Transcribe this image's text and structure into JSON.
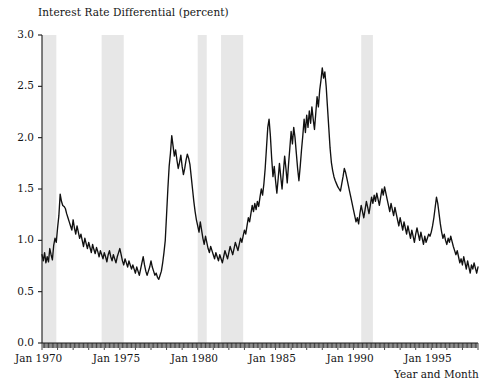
{
  "chart_data": {
    "type": "line",
    "title": "Interest Rate Differential (percent)",
    "xlabel": "Year and Month",
    "ylabel": "",
    "ylim": [
      0.0,
      3.0
    ],
    "xlim": [
      "Jan 1970",
      "Dec 1997"
    ],
    "grid": false,
    "legend": "none",
    "yticks": [
      "0.0",
      "0.5",
      "1.0",
      "1.5",
      "2.0",
      "2.5",
      "3.0"
    ],
    "ytick_values": [
      0.0,
      0.5,
      1.0,
      1.5,
      2.0,
      2.5,
      3.0
    ],
    "xticks": [
      "Jan 1970",
      "Jan 1975",
      "Jan 1980",
      "Jan 1985",
      "Jan 1990",
      "Jan 1995"
    ],
    "xtick_years": [
      1970,
      1975,
      1980,
      1985,
      1990,
      1995
    ],
    "minor_xticks": "monthly",
    "line_color": "#111111",
    "band_color": "#e7e7e7",
    "axis_color": "#1a1a1a",
    "shaded_regions": [
      {
        "name": "recession-1969-1970",
        "start": 1970.0,
        "end": 1970.92
      },
      {
        "name": "recession-1973-1975",
        "start": 1973.83,
        "end": 1975.25
      },
      {
        "name": "recession-1980",
        "start": 1980.0,
        "end": 1980.58
      },
      {
        "name": "recession-1981-1982",
        "start": 1981.5,
        "end": 1982.92
      },
      {
        "name": "recession-1990-1991",
        "start": 1990.5,
        "end": 1991.25
      }
    ],
    "series": [
      {
        "name": "Interest Rate Differential",
        "x_start_year": 1970.0,
        "x_step_years": 0.08333,
        "values": [
          0.86,
          0.8,
          0.88,
          0.78,
          0.84,
          0.79,
          0.92,
          0.86,
          0.81,
          0.95,
          1.02,
          0.98,
          1.12,
          1.24,
          1.45,
          1.38,
          1.34,
          1.33,
          1.31,
          1.26,
          1.22,
          1.18,
          1.14,
          1.1,
          1.2,
          1.12,
          1.06,
          1.14,
          1.08,
          1.02,
          1.06,
          1.0,
          0.94,
          1.02,
          0.97,
          0.92,
          0.98,
          0.93,
          0.88,
          0.96,
          0.91,
          0.87,
          0.93,
          0.89,
          0.84,
          0.9,
          0.86,
          0.82,
          0.88,
          0.84,
          0.79,
          0.86,
          0.9,
          0.84,
          0.8,
          0.86,
          0.82,
          0.78,
          0.84,
          0.88,
          0.92,
          0.86,
          0.8,
          0.76,
          0.82,
          0.78,
          0.74,
          0.8,
          0.76,
          0.72,
          0.76,
          0.72,
          0.68,
          0.74,
          0.7,
          0.66,
          0.72,
          0.78,
          0.84,
          0.76,
          0.7,
          0.66,
          0.7,
          0.74,
          0.8,
          0.74,
          0.7,
          0.66,
          0.68,
          0.64,
          0.62,
          0.66,
          0.7,
          0.78,
          0.88,
          1.0,
          1.25,
          1.5,
          1.72,
          1.85,
          2.02,
          1.92,
          1.82,
          1.88,
          1.78,
          1.7,
          1.76,
          1.83,
          1.72,
          1.64,
          1.7,
          1.78,
          1.84,
          1.8,
          1.74,
          1.62,
          1.5,
          1.38,
          1.28,
          1.2,
          1.14,
          1.08,
          1.18,
          1.1,
          1.02,
          0.96,
          1.04,
          0.98,
          0.92,
          0.88,
          0.94,
          0.9,
          0.86,
          0.82,
          0.88,
          0.84,
          0.8,
          0.86,
          0.82,
          0.78,
          0.84,
          0.9,
          0.86,
          0.82,
          0.88,
          0.94,
          0.9,
          0.86,
          0.92,
          0.98,
          0.94,
          0.9,
          0.96,
          1.02,
          0.98,
          1.04,
          1.1,
          1.06,
          1.14,
          1.22,
          1.18,
          1.26,
          1.34,
          1.28,
          1.36,
          1.3,
          1.38,
          1.33,
          1.42,
          1.5,
          1.44,
          1.55,
          1.7,
          1.9,
          2.1,
          2.18,
          2.02,
          1.8,
          1.62,
          1.72,
          1.58,
          1.46,
          1.6,
          1.75,
          1.62,
          1.5,
          1.66,
          1.82,
          1.7,
          1.56,
          1.74,
          1.9,
          2.06,
          1.94,
          2.1,
          2.0,
          1.85,
          1.7,
          1.58,
          1.72,
          1.88,
          2.02,
          2.18,
          2.05,
          2.22,
          2.1,
          2.26,
          2.14,
          2.3,
          2.18,
          2.08,
          2.24,
          2.4,
          2.3,
          2.46,
          2.56,
          2.68,
          2.58,
          2.64,
          2.5,
          2.3,
          2.1,
          1.9,
          1.76,
          1.68,
          1.62,
          1.58,
          1.55,
          1.52,
          1.5,
          1.48,
          1.55,
          1.62,
          1.7,
          1.66,
          1.6,
          1.54,
          1.48,
          1.42,
          1.36,
          1.3,
          1.24,
          1.18,
          1.22,
          1.16,
          1.26,
          1.34,
          1.28,
          1.22,
          1.3,
          1.38,
          1.32,
          1.26,
          1.34,
          1.42,
          1.36,
          1.44,
          1.38,
          1.46,
          1.4,
          1.34,
          1.42,
          1.5,
          1.44,
          1.52,
          1.46,
          1.4,
          1.34,
          1.28,
          1.36,
          1.3,
          1.24,
          1.32,
          1.26,
          1.2,
          1.14,
          1.22,
          1.16,
          1.1,
          1.18,
          1.12,
          1.06,
          1.14,
          1.08,
          1.02,
          1.1,
          1.04,
          0.98,
          1.06,
          1.12,
          1.06,
          1.0,
          1.08,
          1.02,
          0.96,
          1.04,
          0.98,
          1.02,
          1.06,
          1.04,
          1.08,
          1.14,
          1.22,
          1.32,
          1.42,
          1.36,
          1.26,
          1.16,
          1.08,
          1.02,
          1.06,
          1.0,
          0.96,
          1.02,
          0.98,
          1.04,
          0.99,
          0.94,
          0.9,
          0.86,
          0.9,
          0.84,
          0.78,
          0.82,
          0.76,
          0.84,
          0.78,
          0.72,
          0.8,
          0.74,
          0.68,
          0.76,
          0.72,
          0.78,
          0.73,
          0.68,
          0.74,
          0.7,
          0.66,
          0.72,
          0.68,
          0.64,
          0.7,
          0.66,
          0.62,
          0.68,
          0.64,
          0.6,
          0.58,
          0.62,
          0.66,
          0.62,
          0.58,
          0.62,
          0.66,
          0.64,
          0.6,
          0.65,
          0.7,
          0.66,
          0.62,
          0.68,
          0.64,
          0.7,
          0.66,
          0.62,
          0.68,
          0.65,
          0.62,
          0.68,
          0.66,
          0.64,
          0.68,
          0.66,
          0.64,
          0.67,
          0.65,
          0.68,
          0.66,
          0.64,
          0.67,
          0.66,
          0.65,
          0.67
        ]
      }
    ]
  }
}
